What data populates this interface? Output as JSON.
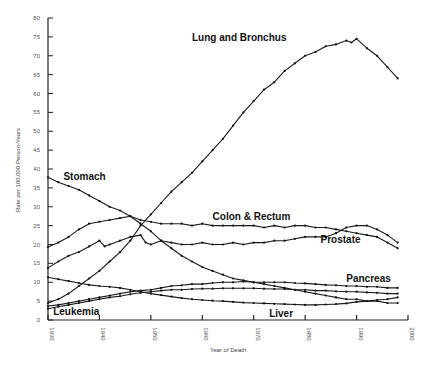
{
  "chart_data": {
    "type": "line",
    "title": "",
    "xlabel": "Year of Death",
    "ylabel": "Rate per 100,000 Person-Years",
    "xlim": [
      1930,
      2000
    ],
    "ylim": [
      0,
      80
    ],
    "x_ticks": [
      "1930",
      "1940",
      "1950",
      "1960",
      "1970",
      "1980",
      "1990",
      "2000"
    ],
    "y_ticks": [
      "0",
      "5",
      "10",
      "15",
      "20",
      "25",
      "30",
      "35",
      "40",
      "45",
      "50",
      "55",
      "60",
      "65",
      "70",
      "75",
      "80"
    ],
    "grid": false,
    "legend": "inline labels",
    "series": [
      {
        "name": "Lung and Bronchus",
        "label_pos": [
          1958,
          74
        ],
        "points": [
          [
            1930,
            4.5
          ],
          [
            1932,
            5.5
          ],
          [
            1934,
            7
          ],
          [
            1936,
            9
          ],
          [
            1938,
            11
          ],
          [
            1940,
            13
          ],
          [
            1942,
            15.5
          ],
          [
            1944,
            18
          ],
          [
            1946,
            21
          ],
          [
            1948,
            25
          ],
          [
            1950,
            28
          ],
          [
            1952,
            31
          ],
          [
            1954,
            34
          ],
          [
            1956,
            36.5
          ],
          [
            1958,
            39
          ],
          [
            1960,
            42
          ],
          [
            1962,
            45
          ],
          [
            1964,
            48
          ],
          [
            1966,
            51.5
          ],
          [
            1968,
            55
          ],
          [
            1970,
            58
          ],
          [
            1972,
            61
          ],
          [
            1974,
            63
          ],
          [
            1976,
            66
          ],
          [
            1978,
            68
          ],
          [
            1980,
            70
          ],
          [
            1982,
            71
          ],
          [
            1984,
            72.5
          ],
          [
            1986,
            73
          ],
          [
            1988,
            74
          ],
          [
            1989,
            73.5
          ],
          [
            1990,
            74.5
          ],
          [
            1992,
            72
          ],
          [
            1994,
            70
          ],
          [
            1996,
            67
          ],
          [
            1998,
            64
          ]
        ]
      },
      {
        "name": "Stomach",
        "label_pos": [
          1933,
          37
        ],
        "points": [
          [
            1930,
            37.8
          ],
          [
            1932,
            36.5
          ],
          [
            1934,
            35.5
          ],
          [
            1936,
            34.5
          ],
          [
            1938,
            33
          ],
          [
            1940,
            31.5
          ],
          [
            1942,
            30
          ],
          [
            1944,
            29
          ],
          [
            1946,
            27.5
          ],
          [
            1948,
            25.5
          ],
          [
            1950,
            23.5
          ],
          [
            1952,
            21
          ],
          [
            1954,
            19
          ],
          [
            1956,
            17
          ],
          [
            1958,
            15.5
          ],
          [
            1960,
            14
          ],
          [
            1962,
            13
          ],
          [
            1964,
            12
          ],
          [
            1966,
            11
          ],
          [
            1968,
            10.5
          ],
          [
            1970,
            10
          ],
          [
            1972,
            9.5
          ],
          [
            1974,
            9
          ],
          [
            1976,
            8.5
          ],
          [
            1978,
            8
          ],
          [
            1980,
            7.5
          ],
          [
            1982,
            7
          ],
          [
            1984,
            6.5
          ],
          [
            1986,
            6
          ],
          [
            1988,
            5.5
          ],
          [
            1990,
            5.5
          ],
          [
            1992,
            5
          ],
          [
            1994,
            5
          ],
          [
            1996,
            4.5
          ],
          [
            1998,
            4.5
          ]
        ]
      },
      {
        "name": "Colon & Rectum",
        "label_pos": [
          1962,
          26.5
        ],
        "points": [
          [
            1930,
            19.3
          ],
          [
            1932,
            20.5
          ],
          [
            1934,
            22
          ],
          [
            1936,
            24
          ],
          [
            1938,
            25.5
          ],
          [
            1940,
            26
          ],
          [
            1942,
            26.5
          ],
          [
            1944,
            27
          ],
          [
            1946,
            27.5
          ],
          [
            1948,
            26.5
          ],
          [
            1950,
            26
          ],
          [
            1952,
            25.5
          ],
          [
            1954,
            25.5
          ],
          [
            1956,
            25.5
          ],
          [
            1958,
            25
          ],
          [
            1960,
            25.5
          ],
          [
            1962,
            25
          ],
          [
            1964,
            25
          ],
          [
            1966,
            25
          ],
          [
            1968,
            25
          ],
          [
            1970,
            25
          ],
          [
            1972,
            24.5
          ],
          [
            1974,
            25
          ],
          [
            1976,
            24.5
          ],
          [
            1978,
            25
          ],
          [
            1980,
            25
          ],
          [
            1982,
            24.5
          ],
          [
            1984,
            24.5
          ],
          [
            1986,
            24
          ],
          [
            1988,
            23.5
          ],
          [
            1990,
            23
          ],
          [
            1992,
            22.5
          ],
          [
            1994,
            22
          ],
          [
            1996,
            20.5
          ],
          [
            1998,
            19
          ]
        ]
      },
      {
        "name": "Prostate",
        "label_pos": [
          1983,
          20.5
        ],
        "points": [
          [
            1930,
            13.8
          ],
          [
            1932,
            15.5
          ],
          [
            1934,
            17
          ],
          [
            1936,
            18
          ],
          [
            1938,
            19.5
          ],
          [
            1940,
            21
          ],
          [
            1941,
            19.5
          ],
          [
            1942,
            20
          ],
          [
            1944,
            21
          ],
          [
            1946,
            22
          ],
          [
            1948,
            22.5
          ],
          [
            1949,
            20.5
          ],
          [
            1950,
            20
          ],
          [
            1952,
            21
          ],
          [
            1954,
            20.5
          ],
          [
            1956,
            20
          ],
          [
            1958,
            20
          ],
          [
            1960,
            20.5
          ],
          [
            1962,
            20
          ],
          [
            1964,
            20
          ],
          [
            1966,
            20.5
          ],
          [
            1968,
            20
          ],
          [
            1970,
            20.5
          ],
          [
            1972,
            20.5
          ],
          [
            1974,
            21
          ],
          [
            1976,
            21
          ],
          [
            1978,
            21.5
          ],
          [
            1980,
            22
          ],
          [
            1982,
            22
          ],
          [
            1984,
            22
          ],
          [
            1986,
            23
          ],
          [
            1988,
            24.5
          ],
          [
            1990,
            25
          ],
          [
            1992,
            25
          ],
          [
            1994,
            24
          ],
          [
            1996,
            22.5
          ],
          [
            1998,
            20.5
          ]
        ]
      },
      {
        "name": "Pancreas",
        "label_pos": [
          1988,
          10
        ],
        "points": [
          [
            1930,
            3.7
          ],
          [
            1932,
            4
          ],
          [
            1934,
            4.5
          ],
          [
            1936,
            5
          ],
          [
            1938,
            5.5
          ],
          [
            1940,
            6
          ],
          [
            1942,
            6.5
          ],
          [
            1944,
            7
          ],
          [
            1946,
            7.5
          ],
          [
            1948,
            7.8
          ],
          [
            1950,
            8
          ],
          [
            1952,
            8.5
          ],
          [
            1954,
            9
          ],
          [
            1956,
            9.2
          ],
          [
            1958,
            9.5
          ],
          [
            1960,
            9.5
          ],
          [
            1962,
            9.8
          ],
          [
            1964,
            10
          ],
          [
            1966,
            10
          ],
          [
            1968,
            10.2
          ],
          [
            1970,
            10
          ],
          [
            1972,
            10
          ],
          [
            1974,
            10
          ],
          [
            1976,
            10
          ],
          [
            1978,
            9.8
          ],
          [
            1980,
            9.7
          ],
          [
            1982,
            9.5
          ],
          [
            1984,
            9.3
          ],
          [
            1986,
            9.2
          ],
          [
            1988,
            9
          ],
          [
            1990,
            9
          ],
          [
            1992,
            8.8
          ],
          [
            1994,
            8.8
          ],
          [
            1996,
            8.5
          ],
          [
            1998,
            8.5
          ]
        ]
      },
      {
        "name": "Leukemia",
        "label_pos": [
          1931,
          1.3
        ],
        "points": [
          [
            1930,
            3
          ],
          [
            1932,
            3.5
          ],
          [
            1934,
            4
          ],
          [
            1936,
            4.5
          ],
          [
            1938,
            5
          ],
          [
            1940,
            5.5
          ],
          [
            1942,
            6
          ],
          [
            1944,
            6.3
          ],
          [
            1946,
            6.8
          ],
          [
            1948,
            7.2
          ],
          [
            1950,
            7.5
          ],
          [
            1952,
            7.8
          ],
          [
            1954,
            8
          ],
          [
            1956,
            8
          ],
          [
            1958,
            8.2
          ],
          [
            1960,
            8.3
          ],
          [
            1962,
            8.3
          ],
          [
            1964,
            8.4
          ],
          [
            1966,
            8.4
          ],
          [
            1968,
            8.4
          ],
          [
            1970,
            8.4
          ],
          [
            1972,
            8.3
          ],
          [
            1974,
            8.2
          ],
          [
            1976,
            8.2
          ],
          [
            1978,
            8
          ],
          [
            1980,
            8
          ],
          [
            1982,
            7.8
          ],
          [
            1984,
            7.8
          ],
          [
            1986,
            7.6
          ],
          [
            1988,
            7.5
          ],
          [
            1990,
            7.5
          ],
          [
            1992,
            7.3
          ],
          [
            1994,
            7.2
          ],
          [
            1996,
            7
          ],
          [
            1998,
            7
          ]
        ]
      },
      {
        "name": "Liver",
        "label_pos": [
          1973,
          0.8
        ],
        "points": [
          [
            1930,
            11.3
          ],
          [
            1932,
            10.8
          ],
          [
            1934,
            10.3
          ],
          [
            1936,
            9.8
          ],
          [
            1938,
            9.3
          ],
          [
            1940,
            9
          ],
          [
            1942,
            8.8
          ],
          [
            1944,
            8.5
          ],
          [
            1946,
            8
          ],
          [
            1948,
            7.5
          ],
          [
            1950,
            7
          ],
          [
            1952,
            6.6
          ],
          [
            1954,
            6.2
          ],
          [
            1956,
            5.8
          ],
          [
            1958,
            5.5
          ],
          [
            1960,
            5.3
          ],
          [
            1962,
            5.1
          ],
          [
            1964,
            5
          ],
          [
            1966,
            4.8
          ],
          [
            1968,
            4.6
          ],
          [
            1970,
            4.5
          ],
          [
            1972,
            4.4
          ],
          [
            1974,
            4.3
          ],
          [
            1976,
            4.2
          ],
          [
            1978,
            4.1
          ],
          [
            1980,
            4
          ],
          [
            1982,
            4
          ],
          [
            1984,
            4.1
          ],
          [
            1986,
            4.2
          ],
          [
            1988,
            4.4
          ],
          [
            1990,
            4.8
          ],
          [
            1992,
            5
          ],
          [
            1994,
            5.3
          ],
          [
            1996,
            5.5
          ],
          [
            1998,
            6
          ]
        ]
      }
    ]
  }
}
